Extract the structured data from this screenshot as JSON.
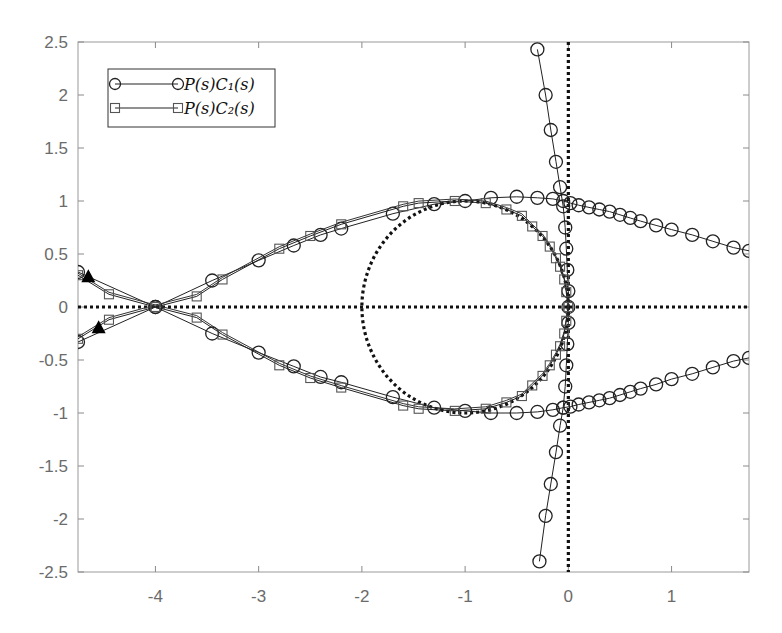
{
  "chart_data": {
    "type": "line",
    "title": "",
    "xlabel": "",
    "ylabel": "",
    "xlim": [
      -4.75,
      1.75
    ],
    "ylim": [
      -2.5,
      2.5
    ],
    "grid": false,
    "legend_position": "upper-left",
    "x_ticks": [
      -4,
      -3,
      -2,
      -1,
      0,
      1
    ],
    "x_tick_labels": [
      "-4",
      "-3",
      "-2",
      "-1",
      "0",
      "1"
    ],
    "y_ticks": [
      2.5,
      2,
      1.5,
      1,
      0.5,
      0,
      -0.5,
      -1,
      -1.5,
      -2,
      -2.5
    ],
    "y_tick_labels": [
      "2.5",
      "2",
      "1.5",
      "1",
      "0.5",
      "0",
      "-0.5",
      "-1",
      "-1.5",
      "-2",
      "-2.5"
    ],
    "legend": [
      {
        "label": "P(s)C₁(s)",
        "marker": "circle"
      },
      {
        "label": "P(s)C₂(s)",
        "marker": "square"
      }
    ],
    "reference_lines": [
      {
        "name": "real-axis",
        "style": "dotted",
        "y": 0
      },
      {
        "name": "imag-axis",
        "style": "dotted",
        "x": 0
      },
      {
        "name": "unit-circle",
        "style": "dotted",
        "center": [
          -1,
          0
        ],
        "radius": 1
      }
    ],
    "series": [
      {
        "name": "P(s)C₁(s)",
        "marker": "circle",
        "branches": [
          {
            "name": "upper",
            "points": [
              [
                -4.75,
                0.33
              ],
              [
                -4.0,
                0.0
              ],
              [
                -3.45,
                0.25
              ],
              [
                -3.0,
                0.44
              ],
              [
                -2.66,
                0.58
              ],
              [
                -2.4,
                0.68
              ],
              [
                -2.2,
                0.74
              ],
              [
                -1.7,
                0.88
              ],
              [
                -1.3,
                0.97
              ],
              [
                -1.0,
                1.0
              ],
              [
                -0.75,
                1.03
              ],
              [
                -0.5,
                1.04
              ],
              [
                -0.3,
                1.03
              ],
              [
                -0.15,
                1.02
              ],
              [
                -0.05,
                1.0
              ],
              [
                0.02,
                0.98
              ],
              [
                0.1,
                0.96
              ],
              [
                0.2,
                0.94
              ],
              [
                0.3,
                0.92
              ],
              [
                0.4,
                0.9
              ],
              [
                0.5,
                0.87
              ],
              [
                0.6,
                0.84
              ],
              [
                0.7,
                0.81
              ],
              [
                0.85,
                0.77
              ],
              [
                1.0,
                0.73
              ],
              [
                1.2,
                0.68
              ],
              [
                1.4,
                0.62
              ],
              [
                1.6,
                0.56
              ],
              [
                1.75,
                0.53
              ]
            ]
          },
          {
            "name": "lower",
            "points": [
              [
                -4.75,
                -0.33
              ],
              [
                -4.0,
                0.0
              ],
              [
                -3.45,
                -0.25
              ],
              [
                -3.0,
                -0.43
              ],
              [
                -2.66,
                -0.56
              ],
              [
                -2.4,
                -0.66
              ],
              [
                -2.2,
                -0.71
              ],
              [
                -1.7,
                -0.85
              ],
              [
                -1.3,
                -0.95
              ],
              [
                -1.0,
                -0.98
              ],
              [
                -0.75,
                -1.0
              ],
              [
                -0.5,
                -1.0
              ],
              [
                -0.3,
                -0.99
              ],
              [
                -0.15,
                -0.97
              ],
              [
                -0.05,
                -0.95
              ],
              [
                0.02,
                -0.94
              ],
              [
                0.1,
                -0.92
              ],
              [
                0.2,
                -0.9
              ],
              [
                0.3,
                -0.88
              ],
              [
                0.4,
                -0.86
              ],
              [
                0.5,
                -0.83
              ],
              [
                0.6,
                -0.8
              ],
              [
                0.7,
                -0.77
              ],
              [
                0.85,
                -0.73
              ],
              [
                1.0,
                -0.68
              ],
              [
                1.2,
                -0.63
              ],
              [
                1.4,
                -0.57
              ],
              [
                1.6,
                -0.51
              ],
              [
                1.75,
                -0.48
              ]
            ]
          },
          {
            "name": "near-imag-axis",
            "points": [
              [
                -0.3,
                2.43
              ],
              [
                -0.22,
                2.0
              ],
              [
                -0.17,
                1.67
              ],
              [
                -0.12,
                1.37
              ],
              [
                -0.08,
                1.13
              ],
              [
                -0.05,
                0.95
              ],
              [
                -0.03,
                0.75
              ],
              [
                -0.02,
                0.55
              ],
              [
                -0.01,
                0.35
              ],
              [
                0.0,
                0.15
              ],
              [
                0.0,
                0.0
              ],
              [
                0.0,
                -0.15
              ],
              [
                -0.01,
                -0.35
              ],
              [
                -0.02,
                -0.55
              ],
              [
                -0.03,
                -0.75
              ],
              [
                -0.05,
                -0.95
              ],
              [
                -0.08,
                -1.12
              ],
              [
                -0.12,
                -1.37
              ],
              [
                -0.17,
                -1.67
              ],
              [
                -0.22,
                -1.97
              ],
              [
                -0.28,
                -2.4
              ]
            ]
          }
        ]
      },
      {
        "name": "P(s)C₂(s)",
        "marker": "square",
        "branches": [
          {
            "name": "upper",
            "points": [
              [
                -4.75,
                0.3
              ],
              [
                -4.45,
                0.12
              ],
              [
                -4.0,
                0.0
              ],
              [
                -3.6,
                0.1
              ],
              [
                -3.35,
                0.26
              ],
              [
                -2.8,
                0.55
              ],
              [
                -2.5,
                0.67
              ],
              [
                -2.2,
                0.78
              ],
              [
                -1.6,
                0.95
              ],
              [
                -1.45,
                0.98
              ],
              [
                -1.1,
                1.0
              ],
              [
                -0.8,
                0.98
              ],
              [
                -0.6,
                0.92
              ],
              [
                -0.45,
                0.86
              ],
              [
                -0.35,
                0.76
              ],
              [
                -0.25,
                0.67
              ],
              [
                -0.18,
                0.57
              ],
              [
                -0.12,
                0.46
              ],
              [
                -0.08,
                0.38
              ],
              [
                -0.04,
                0.26
              ],
              [
                -0.02,
                0.14
              ],
              [
                0.0,
                0.0
              ]
            ]
          },
          {
            "name": "lower",
            "points": [
              [
                -4.75,
                -0.3
              ],
              [
                -4.45,
                -0.12
              ],
              [
                -4.0,
                0.0
              ],
              [
                -3.6,
                -0.1
              ],
              [
                -3.35,
                -0.26
              ],
              [
                -2.8,
                -0.55
              ],
              [
                -2.5,
                -0.67
              ],
              [
                -2.2,
                -0.76
              ],
              [
                -1.6,
                -0.93
              ],
              [
                -1.45,
                -0.96
              ],
              [
                -1.1,
                -0.98
              ],
              [
                -0.8,
                -0.96
              ],
              [
                -0.6,
                -0.9
              ],
              [
                -0.45,
                -0.84
              ],
              [
                -0.35,
                -0.74
              ],
              [
                -0.25,
                -0.65
              ],
              [
                -0.18,
                -0.55
              ],
              [
                -0.12,
                -0.45
              ],
              [
                -0.08,
                -0.37
              ],
              [
                -0.04,
                -0.25
              ],
              [
                -0.02,
                -0.13
              ],
              [
                0.0,
                0.0
              ]
            ]
          }
        ]
      }
    ],
    "annotations": [
      {
        "type": "filled-triangle",
        "x": -4.65,
        "y": 0.28
      },
      {
        "type": "filled-triangle",
        "x": -4.55,
        "y": -0.2
      }
    ]
  }
}
